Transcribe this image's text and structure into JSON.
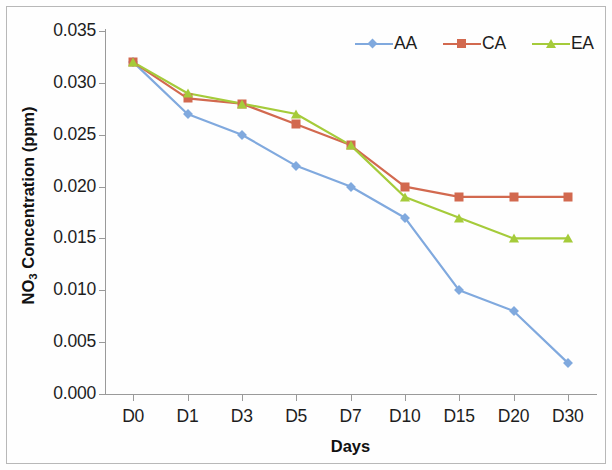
{
  "chart_data": {
    "type": "line",
    "title": "",
    "xlabel": "Days",
    "ylabel": "NO3 Concentration (ppm)",
    "ylabel_main": "NO",
    "ylabel_sub": "3",
    "ylabel_rest": " Concentration (ppm)",
    "categories": [
      "D0",
      "D1",
      "D3",
      "D5",
      "D7",
      "D10",
      "D15",
      "D20",
      "D30"
    ],
    "ylim": [
      0.0,
      0.035
    ],
    "yticks": [
      "0.000",
      "0.005",
      "0.010",
      "0.015",
      "0.020",
      "0.025",
      "0.030",
      "0.035"
    ],
    "ytick_values": [
      0.0,
      0.005,
      0.01,
      0.015,
      0.02,
      0.025,
      0.03,
      0.035
    ],
    "grid": false,
    "legend_position": "top-right",
    "series": [
      {
        "name": "AA",
        "color": "#80a9de",
        "marker": "diamond",
        "values": [
          0.032,
          0.027,
          0.025,
          0.022,
          0.02,
          0.017,
          0.01,
          0.008,
          0.003
        ]
      },
      {
        "name": "CA",
        "color": "#d2694f",
        "marker": "square",
        "values": [
          0.032,
          0.0285,
          0.028,
          0.026,
          0.024,
          0.02,
          0.019,
          0.019,
          0.019
        ]
      },
      {
        "name": "EA",
        "color": "#a5cb3a",
        "marker": "triangle",
        "values": [
          0.032,
          0.029,
          0.028,
          0.027,
          0.024,
          0.019,
          0.017,
          0.015,
          0.015
        ]
      }
    ]
  }
}
